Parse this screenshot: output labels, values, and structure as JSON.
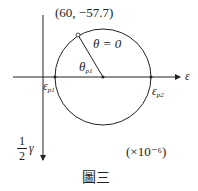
{
  "diagram": {
    "type": "mohr-circle-strain",
    "point_label": "(60, −57.7)",
    "theta_label": "θ = 0",
    "angle_label": "θ",
    "angle_sub": "p1",
    "x_axis_label": "ε",
    "y_axis_num": "1",
    "y_axis_den": "2",
    "y_axis_var": "γ",
    "eps_p1": "ε",
    "eps_p1_sub": "p1",
    "eps_p2": "ε",
    "eps_p2_sub": "p2",
    "scale_note": "(×10⁻⁶)",
    "caption": "圖三"
  }
}
